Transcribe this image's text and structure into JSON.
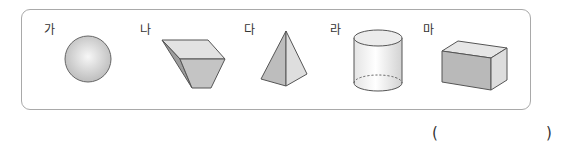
{
  "question": {
    "shapes": [
      {
        "label": "가",
        "icon": "sphere-icon"
      },
      {
        "label": "나",
        "icon": "frustum-prism-icon"
      },
      {
        "label": "다",
        "icon": "pyramid-icon"
      },
      {
        "label": "라",
        "icon": "cylinder-icon"
      },
      {
        "label": "마",
        "icon": "rectangular-prism-icon"
      }
    ],
    "answer_open": "(",
    "answer_close": ")"
  }
}
